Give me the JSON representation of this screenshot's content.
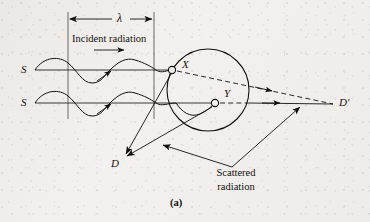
{
  "figure": {
    "caption": "(a)",
    "labels": {
      "wavelength": "λ",
      "incident_radiation": "Incident radiation",
      "scattered_radiation_line1": "Scattered",
      "scattered_radiation_line2": "radiation",
      "source_top": "S",
      "source_bottom": "S",
      "scatterer_x": "X",
      "scatterer_y": "Y",
      "detector_d": "D",
      "detector_d_prime": "D′"
    },
    "colors": {
      "ink": "#13110f",
      "paper": "#f3f1ef",
      "ray": "#1a1715"
    },
    "geometry": {
      "wavelength_span_x": [
        68,
        154
      ],
      "dimension_line_y": 19,
      "guide_line_left_x": 68,
      "guide_line_right_x": 154,
      "guide_line_y_range": [
        12,
        118
      ],
      "ray_top_y": 70,
      "ray_bottom_y": 103,
      "ray_start_x": 35,
      "circle_center": [
        208,
        90
      ],
      "circle_radius": 41,
      "point_x": [
        172,
        70
      ],
      "point_y": [
        215,
        103
      ],
      "point_d": [
        123,
        157
      ],
      "point_d_prime": [
        335,
        104
      ]
    }
  }
}
